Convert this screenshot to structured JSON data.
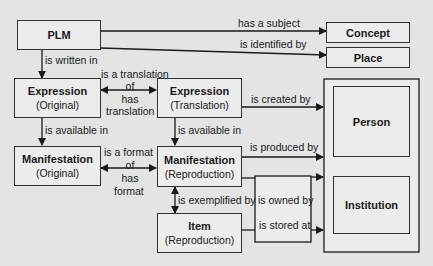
{
  "nodes": {
    "plm": {
      "title": "PLM"
    },
    "concept": {
      "title": "Concept"
    },
    "place": {
      "title": "Place"
    },
    "expr_orig": {
      "title": "Expression",
      "subtitle": "(Original)"
    },
    "expr_trans": {
      "title": "Expression",
      "subtitle": "(Translation)"
    },
    "manif_orig": {
      "title": "Manifestation",
      "subtitle": "(Original)"
    },
    "manif_repro": {
      "title": "Manifestation",
      "subtitle": "(Reproduction)"
    },
    "item_repro": {
      "title": "Item",
      "subtitle": "(Reproduction)"
    },
    "person": {
      "title": "Person"
    },
    "institution": {
      "title": "Institution"
    }
  },
  "edges": {
    "has_subject": "has a subject",
    "is_identified_by": "is identified by",
    "is_written_in": "is written in",
    "translation_top": "is a translation",
    "translation_of": "of",
    "translation_has": "has",
    "translation_bottom": "translation",
    "is_created_by": "is created by",
    "avail_orig": "is  available in",
    "avail_trans": "is  available in",
    "format_top": "is a format",
    "format_of": "of",
    "format_has": "has",
    "format_bottom": "format",
    "is_produced_by": "is produced by",
    "is_exemplified_by": "is exemplified by",
    "is_owned_by": "is owned by",
    "is_stored_at": "is stored at"
  }
}
